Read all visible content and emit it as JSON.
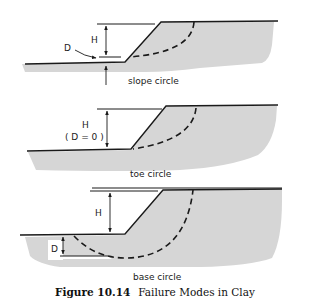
{
  "figure": {
    "number": "Figure 10.14",
    "title": "Failure Modes in Clay"
  },
  "colors": {
    "soil_fill": "#d4d4d4",
    "line": "#1a1a1a",
    "background": "#ffffff"
  },
  "panels": [
    {
      "id": "slope",
      "caption": "slope circle",
      "labels": {
        "H": "H",
        "D": "D"
      }
    },
    {
      "id": "toe",
      "caption": "toe circle",
      "labels": {
        "H": "H",
        "D_note": "( D = 0 )"
      }
    },
    {
      "id": "base",
      "caption": "base circle",
      "labels": {
        "H": "H",
        "D": "D"
      }
    }
  ]
}
